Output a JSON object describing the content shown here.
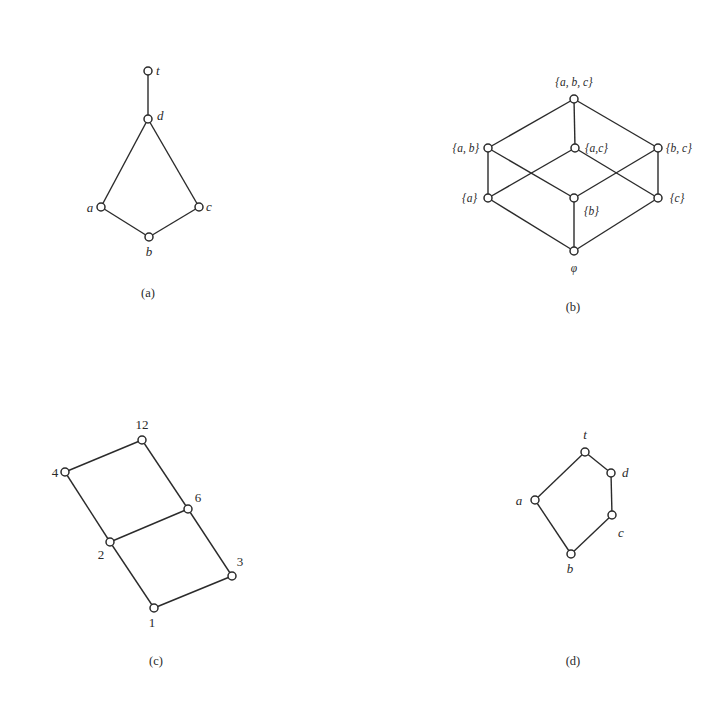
{
  "figure": {
    "panels": [
      {
        "id": "a",
        "caption": "(a)",
        "caption_pos": [
          148,
          297
        ],
        "label_class": "lbl-italic",
        "nodes": [
          {
            "id": "t",
            "label": "t",
            "x": 148,
            "y": 71,
            "lx": 156,
            "ly": 75,
            "anchor": "start"
          },
          {
            "id": "d",
            "label": "d",
            "x": 148,
            "y": 119,
            "lx": 157,
            "ly": 120,
            "anchor": "start"
          },
          {
            "id": "a",
            "label": "a",
            "x": 101,
            "y": 207,
            "lx": 90,
            "ly": 212,
            "anchor": "middle"
          },
          {
            "id": "c",
            "label": "c",
            "x": 199,
            "y": 207,
            "lx": 209,
            "ly": 211,
            "anchor": "middle"
          },
          {
            "id": "b",
            "label": "b",
            "x": 149,
            "y": 237,
            "lx": 149,
            "ly": 256,
            "anchor": "middle"
          }
        ],
        "edges": [
          [
            "t",
            "d"
          ],
          [
            "d",
            "a"
          ],
          [
            "d",
            "c"
          ],
          [
            "a",
            "b"
          ],
          [
            "c",
            "b"
          ]
        ]
      },
      {
        "id": "b",
        "caption": "(b)",
        "caption_pos": [
          573,
          311
        ],
        "label_class": "lbl-set",
        "nodes": [
          {
            "id": "abc",
            "label": "{a, b, c}",
            "x": 574,
            "y": 99,
            "lx": 574,
            "ly": 86,
            "anchor": "middle"
          },
          {
            "id": "ab",
            "label": "{a, b}",
            "x": 488,
            "y": 148,
            "lx": 479,
            "ly": 152,
            "anchor": "end"
          },
          {
            "id": "ac",
            "label": "{a,c}",
            "x": 575,
            "y": 148,
            "lx": 585,
            "ly": 152,
            "anchor": "start"
          },
          {
            "id": "bc",
            "label": "{b, c}",
            "x": 658,
            "y": 148,
            "lx": 666,
            "ly": 152,
            "anchor": "start"
          },
          {
            "id": "a",
            "label": "{a}",
            "x": 488,
            "y": 198,
            "lx": 477,
            "ly": 202,
            "anchor": "end"
          },
          {
            "id": "b",
            "label": "{b}",
            "x": 574,
            "y": 198,
            "lx": 584,
            "ly": 215,
            "anchor": "start"
          },
          {
            "id": "c",
            "label": "{c}",
            "x": 658,
            "y": 198,
            "lx": 670,
            "ly": 202,
            "anchor": "start"
          },
          {
            "id": "empty",
            "label": "φ",
            "x": 574,
            "y": 251,
            "lx": 574,
            "ly": 272,
            "anchor": "middle"
          }
        ],
        "edges": [
          [
            "abc",
            "ab"
          ],
          [
            "abc",
            "ac"
          ],
          [
            "abc",
            "bc"
          ],
          [
            "ab",
            "a"
          ],
          [
            "ab",
            "b"
          ],
          [
            "ac",
            "a"
          ],
          [
            "ac",
            "c"
          ],
          [
            "bc",
            "b"
          ],
          [
            "bc",
            "c"
          ],
          [
            "a",
            "empty"
          ],
          [
            "b",
            "empty"
          ],
          [
            "c",
            "empty"
          ]
        ]
      },
      {
        "id": "c",
        "caption": "(c)",
        "caption_pos": [
          156,
          665
        ],
        "label_class": "lbl-num",
        "nodes": [
          {
            "id": "12",
            "label": "12",
            "x": 142,
            "y": 440,
            "lx": 142,
            "ly": 429,
            "anchor": "middle"
          },
          {
            "id": "4",
            "label": "4",
            "x": 65,
            "y": 472,
            "lx": 55,
            "ly": 477,
            "anchor": "middle"
          },
          {
            "id": "6",
            "label": "6",
            "x": 188,
            "y": 509,
            "lx": 198,
            "ly": 502,
            "anchor": "middle"
          },
          {
            "id": "2",
            "label": "2",
            "x": 110,
            "y": 542,
            "lx": 101,
            "ly": 559,
            "anchor": "middle"
          },
          {
            "id": "3",
            "label": "3",
            "x": 232,
            "y": 576,
            "lx": 240,
            "ly": 566,
            "anchor": "middle"
          },
          {
            "id": "1",
            "label": "1",
            "x": 154,
            "y": 608,
            "lx": 152,
            "ly": 627,
            "anchor": "middle"
          }
        ],
        "edges": [
          [
            "12",
            "4"
          ],
          [
            "12",
            "6"
          ],
          [
            "4",
            "2"
          ],
          [
            "6",
            "2"
          ],
          [
            "6",
            "3"
          ],
          [
            "2",
            "1"
          ],
          [
            "3",
            "1"
          ]
        ]
      },
      {
        "id": "d",
        "caption": "(d)",
        "caption_pos": [
          573,
          665
        ],
        "label_class": "lbl-italic",
        "nodes": [
          {
            "id": "t",
            "label": "t",
            "x": 585,
            "y": 452,
            "lx": 585,
            "ly": 439,
            "anchor": "middle"
          },
          {
            "id": "d",
            "label": "d",
            "x": 611,
            "y": 473,
            "lx": 622,
            "ly": 477,
            "anchor": "start"
          },
          {
            "id": "a",
            "label": "a",
            "x": 535,
            "y": 500,
            "lx": 519,
            "ly": 505,
            "anchor": "middle"
          },
          {
            "id": "c",
            "label": "c",
            "x": 612,
            "y": 515,
            "lx": 621,
            "ly": 537,
            "anchor": "middle"
          },
          {
            "id": "b",
            "label": "b",
            "x": 571,
            "y": 554,
            "lx": 570,
            "ly": 573,
            "anchor": "middle"
          }
        ],
        "edges": [
          [
            "t",
            "d"
          ],
          [
            "t",
            "a"
          ],
          [
            "d",
            "c"
          ],
          [
            "a",
            "b"
          ],
          [
            "c",
            "b"
          ]
        ]
      }
    ]
  },
  "style": {
    "stroke_color": "#2b2b2b",
    "background": "#ffffff",
    "node_radius": 4
  }
}
